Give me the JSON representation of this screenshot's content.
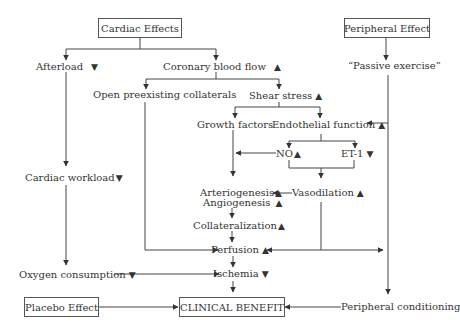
{
  "boxes": {
    "cardiac_effects": "Cardiac Effects",
    "peripheral_effect": "Peripheral Effect",
    "placebo_effect": "Placebo Effect",
    "clinical_benefit": "CLINICAL BENEFIT"
  },
  "nodes": {
    "afterload": "Afterload",
    "coronary_blood_flow": "Coronary blood flow",
    "passive_exercise": "“Passive exercise”",
    "open_collaterals": "Open preexisting collaterals",
    "shear_stress": "Shear stress",
    "growth_factors": "Growth factors",
    "endothelial_function": "Endothelial function",
    "no": "NO",
    "et1": "ET-1",
    "cardiac_workload": "Cardiac workload",
    "arteriogenesis": "Arteriogenesis",
    "angiogenesis": "Angiogenesis",
    "vasodilation": "Vasodilation",
    "collateralization": "Collateralization",
    "perfusion": "Perfusion",
    "oxygen_consumption": "Oxygen consumption",
    "ischemia": "Ischemia",
    "peripheral_conditioning": "Peripheral conditioning"
  },
  "trends": {
    "up": "▲",
    "down": "▼"
  }
}
